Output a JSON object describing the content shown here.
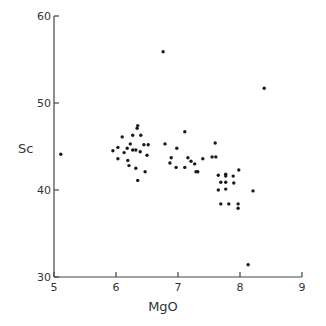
{
  "chart_data": {
    "type": "scatter",
    "title": "",
    "xlabel": "MgO",
    "ylabel": "Sc",
    "xlim": [
      5,
      9
    ],
    "ylim": [
      30,
      60
    ],
    "xticks": [
      5,
      6,
      7,
      8,
      9
    ],
    "yticks": [
      30,
      40,
      50,
      60
    ],
    "grid": false,
    "legend": null,
    "marker_color": "#1a1a1a",
    "axis_color": "#444444",
    "series": [
      {
        "name": "samples",
        "points": [
          [
            5.11,
            44.1
          ],
          [
            5.95,
            44.5
          ],
          [
            6.03,
            44.9
          ],
          [
            6.1,
            46.1
          ],
          [
            6.03,
            43.6
          ],
          [
            6.13,
            44.3
          ],
          [
            6.18,
            44.8
          ],
          [
            6.23,
            45.3
          ],
          [
            6.27,
            46.3
          ],
          [
            6.34,
            47.1
          ],
          [
            6.35,
            47.4
          ],
          [
            6.4,
            46.3
          ],
          [
            6.45,
            45.2
          ],
          [
            6.52,
            45.2
          ],
          [
            6.19,
            43.4
          ],
          [
            6.27,
            44.6
          ],
          [
            6.32,
            44.6
          ],
          [
            6.39,
            44.4
          ],
          [
            6.5,
            44.0
          ],
          [
            6.21,
            42.8
          ],
          [
            6.32,
            42.5
          ],
          [
            6.35,
            41.1
          ],
          [
            6.47,
            42.1
          ],
          [
            6.79,
            45.3
          ],
          [
            6.98,
            44.8
          ],
          [
            7.11,
            46.7
          ],
          [
            6.89,
            43.7
          ],
          [
            6.87,
            43.1
          ],
          [
            6.97,
            42.6
          ],
          [
            7.11,
            42.6
          ],
          [
            7.16,
            43.7
          ],
          [
            7.21,
            43.3
          ],
          [
            7.27,
            43.0
          ],
          [
            7.29,
            42.1
          ],
          [
            7.32,
            42.1
          ],
          [
            7.4,
            43.6
          ],
          [
            6.76,
            55.9
          ],
          [
            8.39,
            51.7
          ],
          [
            7.6,
            45.4
          ],
          [
            7.55,
            43.8
          ],
          [
            7.61,
            43.8
          ],
          [
            7.65,
            41.7
          ],
          [
            7.77,
            41.8
          ],
          [
            7.77,
            41.6
          ],
          [
            7.89,
            41.6
          ],
          [
            7.98,
            42.3
          ],
          [
            7.69,
            40.9
          ],
          [
            7.77,
            40.9
          ],
          [
            7.9,
            40.8
          ],
          [
            7.65,
            40.0
          ],
          [
            7.77,
            40.1
          ],
          [
            8.21,
            39.9
          ],
          [
            7.69,
            38.4
          ],
          [
            7.82,
            38.4
          ],
          [
            7.97,
            38.4
          ],
          [
            7.97,
            37.9
          ],
          [
            8.13,
            31.4
          ]
        ]
      }
    ]
  },
  "labels": {
    "xlabel": "MgO",
    "ylabel": "Sc",
    "xticks": [
      "5",
      "6",
      "7",
      "8",
      "9"
    ],
    "yticks": [
      "30",
      "40",
      "50",
      "60"
    ]
  }
}
